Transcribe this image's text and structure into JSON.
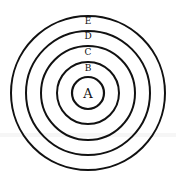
{
  "diagram": {
    "type": "concentric-circles",
    "center": [
      88,
      93
    ],
    "rings": [
      {
        "label": "E",
        "radius": 77
      },
      {
        "label": "D",
        "radius": 62
      },
      {
        "label": "C",
        "radius": 47
      },
      {
        "label": "B",
        "radius": 31
      },
      {
        "label": "A",
        "radius": 16
      }
    ],
    "stroke_color": "#111111",
    "background": "#ffffff"
  }
}
